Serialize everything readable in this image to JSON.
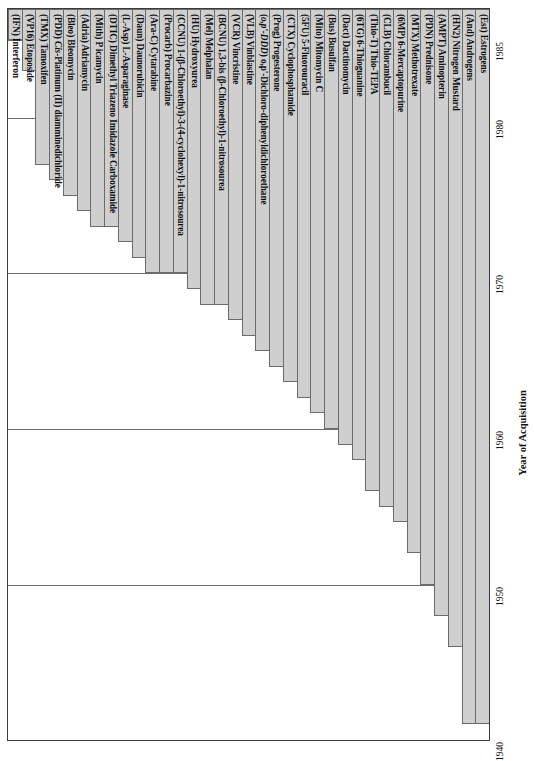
{
  "chart_data": {
    "type": "bar",
    "title": "",
    "xlabel": "",
    "ylabel": "Year of Acquisition",
    "orientation": "vertical-bars-downward",
    "ylim": [
      1940,
      1987
    ],
    "yticks": [
      1985,
      1980,
      1970,
      1960,
      1950,
      1940
    ],
    "ytick_labels": [
      "1985",
      "1980",
      "1970",
      "1960",
      "1950",
      "1940"
    ],
    "grid": true,
    "legend": "none",
    "value_label": "Year of Acquisition (bar extends from acquisition year to 1987 baseline top)",
    "categories": [
      "(IFN) Interferon",
      "(VP16) Etoposide",
      "(TMX) Tamoxifen",
      "(PDD) Cis-Platinum (II) diamminedichloride",
      "(Bleo) Bleomycin",
      "(Adria) Adriamycin",
      "(Mith) P icamycin",
      "(DTIC) Dimethyl Triazeno Imidazole Carboxamide",
      "(L-Asp) L-Asparaginase",
      "(Daun) Daunorubicin",
      "(Ara-C) Cytarabine",
      "(Procarb) Procarbazine",
      "(CCNU) 1-(β-Chloroethyl)-3-(4-cyclohexyl)-1-nitrosourea",
      "(HU) Hydroxyurea",
      "(Mel) Melphalan",
      "(BCNU) 1,3-bis (β-Chloroethyl)-1-nitrosourea",
      "(VCR) Vincristine",
      "(VLB) Vinblastine",
      "(o,p'-DDD) o,p'-Dichloro-diphenyldichloroethane",
      "(Prog) Progesterone",
      "(CTX) Cyclophosphamide",
      "(5FU) 5-Fluorouracil",
      "(Mito) Mitomycin C",
      "(Bus) Busulfan",
      "(Dact) Dactinomycin",
      "(6TG) 6-Thioguanine",
      "(Thio-T) Thio-TEPA",
      "(CLB) Chlorambucil",
      "(6MP) 6-Mercaptopurine",
      "(MTX) Methotrexate",
      "(PDN) Prednisone",
      "(AMPT) Aminopterin",
      "(HN2) Nitrogen Mustard",
      "(And) Androgens",
      "(Est) Estrogens"
    ],
    "values": [
      1985,
      1983,
      1977,
      1976,
      1975,
      1974,
      1973,
      1973,
      1972,
      1971,
      1970,
      1970,
      1970,
      1969,
      1968,
      1968,
      1967,
      1966,
      1965,
      1964,
      1963,
      1962,
      1961,
      1960,
      1959,
      1958,
      1956,
      1955,
      1954,
      1952,
      1950,
      1948,
      1946,
      1941,
      1941
    ],
    "label_styles": [
      {
        "index": 3,
        "italic_part": "Cis"
      },
      {
        "index": 18,
        "italic_part": "o,p'-DDD"
      }
    ],
    "n_categories": 35,
    "baseline_year": 1987
  },
  "axis": {
    "y_title": "Year of Acquisition",
    "ticks": [
      {
        "label": "1985",
        "year": 1985
      },
      {
        "label": "1980",
        "year": 1980
      },
      {
        "label": "1970",
        "year": 1970
      },
      {
        "label": "1960",
        "year": 1960
      },
      {
        "label": "1950",
        "year": 1950
      },
      {
        "label": "1940",
        "year": 1940
      }
    ]
  },
  "colors": {
    "bar_fill": "#cfcfcf",
    "bar_stroke": "#6b6b6b",
    "grid": "#6e6e6e",
    "frame": "#3a3a3a",
    "text": "#111111",
    "background": "#ffffff"
  }
}
